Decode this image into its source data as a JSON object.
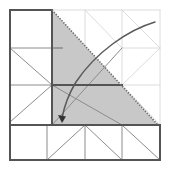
{
  "figure": {
    "title": "Geometric grid construction with shaded right triangle and curved pointer arrow",
    "canvas": {
      "width": 171,
      "height": 171,
      "background": "#ffffff"
    },
    "colors": {
      "outline_dark": "#545454",
      "grid_medium": "#8c8c8c",
      "grid_light": "#dcdcdc",
      "shade_fill": "#c8c8c8",
      "dotted_edge": "#6e6e6e",
      "arrow_stroke": "#5a5a5a",
      "tick_mark": "#9a9a9a"
    },
    "bounds": {
      "left": 10,
      "top": 10,
      "right": 160,
      "bottom": 160
    },
    "grid": {
      "vertical_x": [
        10,
        52,
        85,
        122,
        160
      ],
      "horizontal_y": [
        10,
        48,
        85,
        125,
        160
      ],
      "label": "nested square grid"
    },
    "shaded_region": {
      "name": "right-triangle-shade",
      "points": "52,10 158,125 52,125",
      "fill": "#c8c8c8",
      "note": "shaded right triangle occupying upper-middle-right of the square"
    },
    "dotted_hypotenuse": {
      "from": [
        52,
        10
      ],
      "to": [
        158,
        125
      ],
      "style": "dotted",
      "color": "#6e6e6e"
    },
    "arrow": {
      "name": "curved-pointer-arrow",
      "path": "M155,22 C128,30 96,52 76,82 C68,95 64,108 62,118",
      "head_at": [
        62,
        120
      ],
      "direction": "from top-right toward lower-left interior",
      "color": "#5a5a5a"
    },
    "tick_mark": {
      "from": [
        53,
        48
      ],
      "to": [
        63,
        48
      ],
      "color": "#9a9a9a"
    },
    "medium_lines": [
      {
        "name": "outer-left-edge",
        "from": [
          10,
          10
        ],
        "to": [
          10,
          160
        ]
      },
      {
        "name": "outer-bottom-edge",
        "from": [
          10,
          160
        ],
        "to": [
          160,
          160
        ]
      },
      {
        "name": "outer-top-edge-left",
        "from": [
          10,
          10
        ],
        "to": [
          52,
          10
        ]
      },
      {
        "name": "outer-right-edge-lower",
        "from": [
          160,
          125
        ],
        "to": [
          160,
          160
        ]
      },
      {
        "name": "vertical-at-52",
        "from": [
          52,
          10
        ],
        "to": [
          52,
          125
        ]
      },
      {
        "name": "horizontal-at-125",
        "from": [
          10,
          125
        ],
        "to": [
          160,
          125
        ]
      },
      {
        "name": "horizontal-at-85-mid",
        "from": [
          52,
          85
        ],
        "to": [
          122,
          85
        ]
      }
    ],
    "thin_lines": [
      {
        "name": "horizontal-at-48-left",
        "from": [
          10,
          48
        ],
        "to": [
          52,
          48
        ]
      },
      {
        "name": "horizontal-at-85-left",
        "from": [
          10,
          85
        ],
        "to": [
          52,
          85
        ]
      },
      {
        "name": "vertical-at-85-bottom",
        "from": [
          85,
          125
        ],
        "to": [
          85,
          160
        ]
      },
      {
        "name": "vertical-at-122-bottom",
        "from": [
          122,
          125
        ],
        "to": [
          122,
          160
        ]
      },
      {
        "name": "vertical-at-47-bottom",
        "from": [
          47,
          125
        ],
        "to": [
          47,
          160
        ]
      },
      {
        "name": "diag-upleft-a",
        "from": [
          10,
          48
        ],
        "to": [
          52,
          85
        ]
      },
      {
        "name": "diag-upleft-b",
        "from": [
          10,
          122
        ],
        "to": [
          52,
          85
        ]
      },
      {
        "name": "diag-center-a",
        "from": [
          52,
          85
        ],
        "to": [
          122,
          125
        ]
      },
      {
        "name": "diag-center-b",
        "from": [
          52,
          125
        ],
        "to": [
          122,
          48
        ]
      },
      {
        "name": "diag-bottom-a",
        "from": [
          47,
          160
        ],
        "to": [
          85,
          125
        ]
      },
      {
        "name": "diag-bottom-b",
        "from": [
          85,
          125
        ],
        "to": [
          122,
          160
        ]
      },
      {
        "name": "diag-bottom-c",
        "from": [
          122,
          125
        ],
        "to": [
          160,
          160
        ]
      }
    ],
    "light_lines": [
      {
        "name": "light-vertical-122-top",
        "from": [
          122,
          10
        ],
        "to": [
          122,
          125
        ]
      },
      {
        "name": "light-vertical-160-top",
        "from": [
          160,
          10
        ],
        "to": [
          160,
          125
        ]
      },
      {
        "name": "light-horizontal-10-right",
        "from": [
          52,
          10
        ],
        "to": [
          160,
          10
        ]
      },
      {
        "name": "light-horizontal-48-right",
        "from": [
          122,
          48
        ],
        "to": [
          160,
          48
        ]
      },
      {
        "name": "light-horizontal-85-right",
        "from": [
          122,
          85
        ],
        "to": [
          160,
          85
        ]
      },
      {
        "name": "light-diag-right-a",
        "from": [
          122,
          10
        ],
        "to": [
          160,
          48
        ]
      },
      {
        "name": "light-diag-right-b",
        "from": [
          122,
          85
        ],
        "to": [
          160,
          48
        ]
      },
      {
        "name": "light-diag-right-c",
        "from": [
          122,
          85
        ],
        "to": [
          160,
          125
        ]
      },
      {
        "name": "light-diag-upper-a",
        "from": [
          85,
          10
        ],
        "to": [
          122,
          48
        ]
      },
      {
        "name": "light-vertical-85-top",
        "from": [
          85,
          10
        ],
        "to": [
          85,
          48
        ]
      }
    ]
  }
}
